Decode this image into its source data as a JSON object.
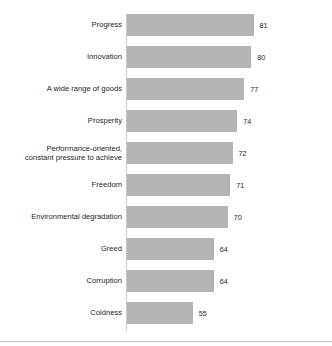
{
  "chart_data": {
    "type": "bar",
    "orientation": "horizontal",
    "title": "",
    "subtitle": "",
    "xlabel": "",
    "ylabel": "",
    "grid": false,
    "legend": null,
    "axis_baseline_value": 27,
    "xlim": [
      27,
      81
    ],
    "categories": [
      "Progress",
      "Innovation",
      "A wide range of goods",
      "Prosperity",
      "Performance-oriented,\nconstant pressure to achieve",
      "Freedom",
      "Environmental degradation",
      "Greed",
      "Corruption",
      "Coldness"
    ],
    "values": [
      81,
      80,
      77,
      74,
      72,
      71,
      70,
      64,
      64,
      55
    ],
    "value_labels": [
      "81",
      "80",
      "77",
      "74",
      "72",
      "71",
      "70",
      "64",
      "64",
      "55"
    ],
    "bars": [
      {
        "label": "Progress",
        "value": 81,
        "value_label": "81"
      },
      {
        "label": "Innovation",
        "value": 80,
        "value_label": "80"
      },
      {
        "label": "A wide range of goods",
        "value": 77,
        "value_label": "77"
      },
      {
        "label": "Prosperity",
        "value": 74,
        "value_label": "74"
      },
      {
        "label": "Performance-oriented,\nconstant pressure to achieve",
        "value": 72,
        "value_label": "72"
      },
      {
        "label": "Freedom",
        "value": 71,
        "value_label": "71"
      },
      {
        "label": "Environmental degradation",
        "value": 70,
        "value_label": "70"
      },
      {
        "label": "Greed",
        "value": 64,
        "value_label": "64"
      },
      {
        "label": "Corruption",
        "value": 64,
        "value_label": "64"
      },
      {
        "label": "Coldness",
        "value": 55,
        "value_label": "55"
      }
    ],
    "colors": {
      "bar_fill": "#b4b4b4",
      "axis_line": "#c8c8c8",
      "label_text": "#231f20",
      "value_text": "#231f20",
      "background": "#ffffff",
      "bottom_rule": "#c4c6c8"
    }
  }
}
